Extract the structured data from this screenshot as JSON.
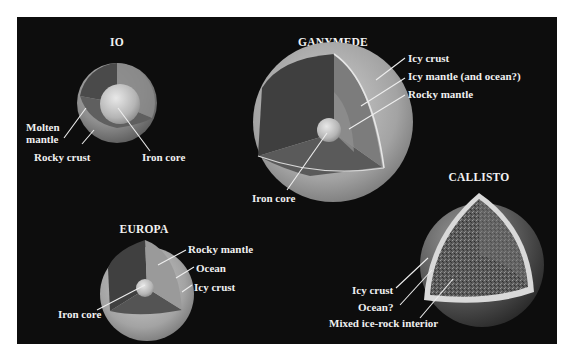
{
  "figure": {
    "background_color": "#0d0d0d",
    "moons": {
      "io": {
        "name": "IO",
        "labels": [
          "Molten mantle",
          "Rocky crust",
          "Iron core"
        ],
        "label_molten_1": "Molten",
        "label_molten_2": "mantle",
        "label_rocky_crust": "Rocky crust",
        "label_iron_core": "Iron core"
      },
      "ganymede": {
        "name": "GANYMEDE",
        "label_icy_crust": "Icy crust",
        "label_icy_mantle": "Icy mantle (and ocean?)",
        "label_rocky_mantle": "Rocky mantle",
        "label_iron_core": "Iron core"
      },
      "europa": {
        "name": "EUROPA",
        "label_rocky_mantle": "Rocky mantle",
        "label_ocean": "Ocean",
        "label_icy_crust": "Icy crust",
        "label_iron_core": "Iron core"
      },
      "callisto": {
        "name": "CALLISTO",
        "label_icy_crust": "Icy crust",
        "label_ocean": "Ocean?",
        "label_interior": "Mixed ice-rock interior"
      }
    }
  }
}
